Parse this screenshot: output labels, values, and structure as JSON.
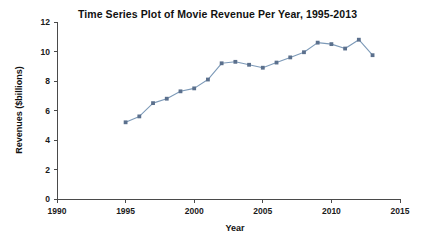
{
  "chart_data": {
    "type": "line",
    "title": "Time Series Plot of Movie Revenue Per Year, 1995-2013",
    "xlabel": "Year",
    "ylabel": "Revenues ($billions)",
    "xlim": [
      1990,
      2015
    ],
    "ylim": [
      0,
      12
    ],
    "xticks": [
      1990,
      1995,
      2000,
      2005,
      2010,
      2015
    ],
    "yticks": [
      0,
      2,
      4,
      6,
      8,
      10,
      12
    ],
    "grid": false,
    "legend": null,
    "x": [
      1995,
      1996,
      1997,
      1998,
      1999,
      2000,
      2001,
      2002,
      2003,
      2004,
      2005,
      2006,
      2007,
      2008,
      2009,
      2010,
      2011,
      2012,
      2013
    ],
    "values": [
      5.2,
      5.6,
      6.5,
      6.8,
      7.3,
      7.5,
      8.1,
      9.2,
      9.3,
      9.1,
      8.9,
      9.25,
      9.6,
      9.95,
      10.6,
      10.5,
      10.2,
      10.8,
      9.75
    ],
    "series": [
      {
        "name": "Movie Revenue",
        "line_color": "#7d9ab8",
        "marker_color": "#5b708d",
        "marker": "square",
        "values": [
          5.2,
          5.6,
          6.5,
          6.8,
          7.3,
          7.5,
          8.1,
          9.2,
          9.3,
          9.1,
          8.9,
          9.25,
          9.6,
          9.95,
          10.6,
          10.5,
          10.2,
          10.8,
          9.75
        ]
      }
    ]
  },
  "figure": {
    "background": "#ffffff",
    "axis_color": "#4a4a4a"
  }
}
